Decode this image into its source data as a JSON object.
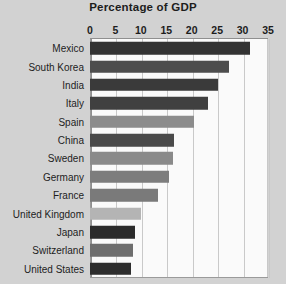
{
  "chart_data": {
    "type": "bar",
    "orientation": "horizontal",
    "title": "Percentage of GDP",
    "xlabel": "",
    "ylabel": "",
    "xlim": [
      0,
      35
    ],
    "xticks": [
      0,
      5,
      10,
      15,
      20,
      25,
      30,
      35
    ],
    "xtick_labels": [
      "0",
      "5",
      "10",
      "15",
      "20",
      "25",
      "30",
      "35"
    ],
    "grid": true,
    "legend": "none",
    "categories": [
      "Mexico",
      "South Korea",
      "India",
      "Italy",
      "Spain",
      "China",
      "Sweden",
      "Germany",
      "France",
      "United Kingdom",
      "Japan",
      "Switzerland",
      "United States"
    ],
    "values": [
      31.5,
      27.3,
      25.1,
      23.2,
      20.5,
      16.6,
      16.4,
      15.5,
      13.3,
      10.1,
      8.8,
      8.4,
      8.1
    ],
    "bar_colors": [
      "#333333",
      "#4d4d4d",
      "#3a3a3a",
      "#404040",
      "#8c8c8c",
      "#4a4a4a",
      "#8a8a8a",
      "#7d7d7d",
      "#7a7a7a",
      "#b4b4b4",
      "#2b2b2b",
      "#6e6e6e",
      "#2d2d2d"
    ],
    "plot_background": "#fafafa",
    "page_background": "#d2d2d2",
    "text_color": "#1d1d1d"
  }
}
